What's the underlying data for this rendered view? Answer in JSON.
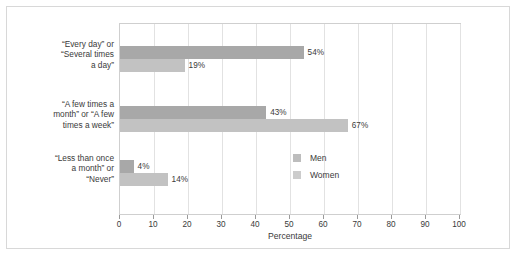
{
  "chart_data": {
    "type": "bar",
    "orientation": "horizontal",
    "title": "",
    "xlabel": "Percentage",
    "ylabel": "",
    "xlim": [
      0,
      100
    ],
    "xticks": [
      0,
      10,
      20,
      30,
      40,
      50,
      60,
      70,
      80,
      90,
      100
    ],
    "xticklabels": [
      "0",
      "10",
      "20",
      "30",
      "40",
      "50",
      "60",
      "70",
      "80",
      "90",
      "100"
    ],
    "grid": true,
    "legend_position": "inside-right",
    "categories": [
      "“Every day” or “Several times a day”",
      "“A few times a month” or “A few times a week”",
      "“Less than once a month” or “Never”"
    ],
    "category_lines": [
      [
        "“Every day” or",
        "“Several times",
        "a day”"
      ],
      [
        "“A few times a",
        "month” or “A few",
        "times a week”"
      ],
      [
        "“Less than once",
        "a month” or",
        "“Never”"
      ]
    ],
    "series": [
      {
        "name": "Men",
        "color": "#a8a8a8",
        "values": [
          54,
          43,
          4
        ],
        "value_labels": [
          "54%",
          "43%",
          "4%"
        ]
      },
      {
        "name": "Women",
        "color": "#c2c2c2",
        "values": [
          19,
          67,
          14
        ],
        "value_labels": [
          "19%",
          "67%",
          "14%"
        ]
      }
    ]
  },
  "legend": {
    "items": [
      {
        "label": "Men",
        "color": "#bdbdbd"
      },
      {
        "label": "Women",
        "color": "#cccccc"
      }
    ]
  },
  "axis": {
    "xlabel": "Percentage"
  }
}
